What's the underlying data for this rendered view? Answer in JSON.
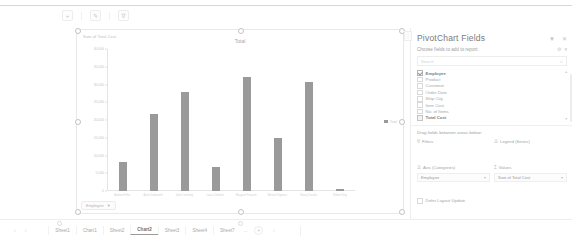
{
  "app": {
    "name": "Microsoft Excel",
    "chart_sheet": "Chart2"
  },
  "chart_toolbar": {
    "buttons": [
      {
        "name": "chart-elements",
        "glyph": "+"
      },
      {
        "name": "chart-styles",
        "glyph": "✎"
      },
      {
        "name": "chart-filters",
        "glyph": "∇"
      }
    ]
  },
  "chart_object": {
    "axis_title": "Sum of Total Cost",
    "field_button_label": "Employee",
    "field_button_icon": "▼"
  },
  "chart_data": {
    "type": "bar",
    "title": "Total",
    "xlabel": "",
    "ylabel": "Sum of Total Cost",
    "ylim": [
      0,
      40000
    ],
    "yticks": [
      0,
      5000,
      10000,
      15000,
      20000,
      25000,
      30000,
      35000,
      40000
    ],
    "ytick_labels": [
      "0",
      "5,000",
      "10,000",
      "15,000",
      "20,000",
      "25,000",
      "30,000",
      "35,000",
      "40,000"
    ],
    "grid": false,
    "legend_position": "right",
    "legend": [
      "Total"
    ],
    "bar_color": "#9a9a9a",
    "categories": [
      "Andrew Fuller",
      "Anne Dodsworth",
      "Janet Leverling",
      "Laura Callahan",
      "Margaret Peacock",
      "Michael Suyama",
      "Nancy Davolio",
      "Robert King"
    ],
    "values": [
      8200,
      21600,
      27900,
      6900,
      32100,
      14800,
      30600,
      600
    ],
    "series": [
      {
        "name": "Total",
        "values": [
          8200,
          21600,
          27900,
          6900,
          32100,
          14800,
          30600,
          600
        ]
      }
    ]
  },
  "pane": {
    "title": "PivotChart Fields",
    "header_icons": [
      {
        "name": "pane-options-icon",
        "glyph": "▼"
      },
      {
        "name": "pane-close-icon",
        "glyph": "✕"
      }
    ],
    "subtitle": "Choose fields to add to report:",
    "subtitle_icons": [
      {
        "name": "tools-gear-icon",
        "glyph": "⚙"
      },
      {
        "name": "tools-dropdown-icon",
        "glyph": "▾"
      }
    ],
    "search_placeholder": "Search",
    "search_icon": "⌕",
    "fields": [
      {
        "label": "Employee",
        "checked": true,
        "bold": true,
        "style": "check"
      },
      {
        "label": "Product",
        "checked": false,
        "bold": false,
        "style": "box"
      },
      {
        "label": "Customer",
        "checked": false,
        "bold": false,
        "style": "box"
      },
      {
        "label": "Order Date",
        "checked": false,
        "bold": false,
        "style": "box"
      },
      {
        "label": "Ship City",
        "checked": false,
        "bold": false,
        "style": "box"
      },
      {
        "label": "Item Cost",
        "checked": false,
        "bold": false,
        "style": "box"
      },
      {
        "label": "No. of Items",
        "checked": false,
        "bold": false,
        "style": "box"
      },
      {
        "label": "Total Cost",
        "checked": true,
        "bold": true,
        "style": "sigma"
      }
    ],
    "drag_label": "Drag fields between areas below:",
    "areas": [
      {
        "name": "filters",
        "icon": "∇",
        "label": "Filters",
        "items": []
      },
      {
        "name": "legend",
        "icon": "☰",
        "label": "Legend (Series)",
        "items": []
      },
      {
        "name": "axis",
        "icon": "☰",
        "label": "Axis (Categories)",
        "items": [
          {
            "text": "Employee",
            "chevron": "▾"
          }
        ]
      },
      {
        "name": "values",
        "icon": "Σ",
        "label": "Values",
        "items": [
          {
            "text": "Sum of Total Cost",
            "chevron": "▾"
          }
        ]
      }
    ],
    "defer_label": "Defer Layout Update",
    "defer_checked": false,
    "grip_icon": "⋮"
  },
  "tabbar": {
    "nav_arrows": [
      "‹",
      "›"
    ],
    "tabs": [
      {
        "label": "Sheet1",
        "active": false
      },
      {
        "label": "Chart1",
        "active": false
      },
      {
        "label": "Sheet2",
        "active": false
      },
      {
        "label": "Chart2",
        "active": true
      },
      {
        "label": "Sheet3",
        "active": false
      },
      {
        "label": "Sheet4",
        "active": false
      },
      {
        "label": "Sheet7",
        "active": false
      }
    ],
    "ellipsis": "…",
    "add_sheet_icon": "+",
    "tail_icon": "‹"
  }
}
